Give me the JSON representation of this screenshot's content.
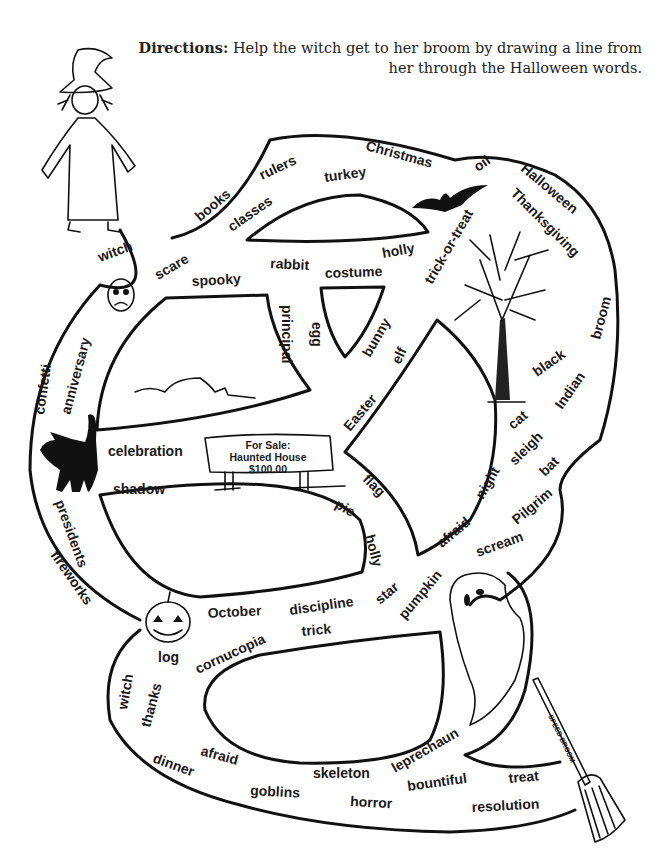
{
  "directions": {
    "label": "Directions:",
    "text": " Help the witch get to her broom by drawing a line from her through the Halloween words."
  },
  "sign": {
    "line1": "For Sale:",
    "line2": "Haunted House",
    "line3": "$100.00"
  },
  "broom_label": "SPEED BROOM",
  "words": [
    {
      "text": "witch",
      "x": 100,
      "y": 262,
      "r": -20
    },
    {
      "text": "books",
      "x": 200,
      "y": 222,
      "r": -40
    },
    {
      "text": "rulers",
      "x": 262,
      "y": 180,
      "r": -25
    },
    {
      "text": "turkey",
      "x": 325,
      "y": 182,
      "r": -8
    },
    {
      "text": "Christmas",
      "x": 365,
      "y": 150,
      "r": 15
    },
    {
      "text": "oil",
      "x": 478,
      "y": 172,
      "r": -35
    },
    {
      "text": "Halloween",
      "x": 520,
      "y": 170,
      "r": 40
    },
    {
      "text": "Thanksgiving",
      "x": 510,
      "y": 194,
      "r": 45
    },
    {
      "text": "classes",
      "x": 232,
      "y": 232,
      "r": -35
    },
    {
      "text": "scare",
      "x": 158,
      "y": 280,
      "r": -30
    },
    {
      "text": "rabbit",
      "x": 270,
      "y": 268,
      "r": 3
    },
    {
      "text": "holly",
      "x": 383,
      "y": 258,
      "r": -10
    },
    {
      "text": "costume",
      "x": 325,
      "y": 278,
      "r": -2
    },
    {
      "text": "trick-or-treat",
      "x": 432,
      "y": 285,
      "r": -60
    },
    {
      "text": "spooky",
      "x": 192,
      "y": 286,
      "r": -3
    },
    {
      "text": "principal",
      "x": 282,
      "y": 305,
      "r": 90
    },
    {
      "text": "egg",
      "x": 312,
      "y": 322,
      "r": 90
    },
    {
      "text": "bunny",
      "x": 370,
      "y": 358,
      "r": -60
    },
    {
      "text": "elf",
      "x": 400,
      "y": 365,
      "r": -65
    },
    {
      "text": "broom",
      "x": 600,
      "y": 340,
      "r": -75
    },
    {
      "text": "black",
      "x": 537,
      "y": 377,
      "r": -35
    },
    {
      "text": "confetti",
      "x": 44,
      "y": 415,
      "r": -82
    },
    {
      "text": "anniversary",
      "x": 70,
      "y": 415,
      "r": -75
    },
    {
      "text": "Easter",
      "x": 350,
      "y": 432,
      "r": -50
    },
    {
      "text": "Indian",
      "x": 562,
      "y": 410,
      "r": -55
    },
    {
      "text": "cat",
      "x": 513,
      "y": 430,
      "r": -40
    },
    {
      "text": "celebration",
      "x": 108,
      "y": 456,
      "r": 0
    },
    {
      "text": "sleigh",
      "x": 515,
      "y": 466,
      "r": -45
    },
    {
      "text": "bat",
      "x": 545,
      "y": 477,
      "r": -45
    },
    {
      "text": "shadow",
      "x": 113,
      "y": 494,
      "r": 0
    },
    {
      "text": "flag",
      "x": 362,
      "y": 480,
      "r": 45
    },
    {
      "text": "night",
      "x": 483,
      "y": 500,
      "r": -60
    },
    {
      "text": "pie",
      "x": 334,
      "y": 507,
      "r": 30
    },
    {
      "text": "Pilgrim",
      "x": 517,
      "y": 525,
      "r": -40
    },
    {
      "text": "presidents",
      "x": 55,
      "y": 502,
      "r": 70
    },
    {
      "text": "holly",
      "x": 365,
      "y": 536,
      "r": 75
    },
    {
      "text": "afraid",
      "x": 442,
      "y": 548,
      "r": -40
    },
    {
      "text": "scream",
      "x": 478,
      "y": 557,
      "r": -20
    },
    {
      "text": "fireworks",
      "x": 50,
      "y": 555,
      "r": 55
    },
    {
      "text": "star",
      "x": 380,
      "y": 605,
      "r": -40
    },
    {
      "text": "pumpkin",
      "x": 405,
      "y": 620,
      "r": -50
    },
    {
      "text": "discipline",
      "x": 290,
      "y": 615,
      "r": -8
    },
    {
      "text": "October",
      "x": 208,
      "y": 618,
      "r": -3
    },
    {
      "text": "trick",
      "x": 302,
      "y": 636,
      "r": -5
    },
    {
      "text": "log",
      "x": 158,
      "y": 662,
      "r": 0
    },
    {
      "text": "cornucopia",
      "x": 198,
      "y": 674,
      "r": -25
    },
    {
      "text": "witch",
      "x": 127,
      "y": 710,
      "r": -80
    },
    {
      "text": "thanks",
      "x": 150,
      "y": 728,
      "r": -75
    },
    {
      "text": "leprechaun",
      "x": 395,
      "y": 773,
      "r": -30
    },
    {
      "text": "afraid",
      "x": 200,
      "y": 755,
      "r": 15
    },
    {
      "text": "dinner",
      "x": 152,
      "y": 762,
      "r": 20
    },
    {
      "text": "skeleton",
      "x": 313,
      "y": 778,
      "r": 0
    },
    {
      "text": "bountiful",
      "x": 408,
      "y": 791,
      "r": -8
    },
    {
      "text": "treat",
      "x": 509,
      "y": 783,
      "r": -5
    },
    {
      "text": "goblins",
      "x": 250,
      "y": 795,
      "r": 3
    },
    {
      "text": "horror",
      "x": 350,
      "y": 806,
      "r": 3
    },
    {
      "text": "resolution",
      "x": 472,
      "y": 812,
      "r": -3
    }
  ]
}
